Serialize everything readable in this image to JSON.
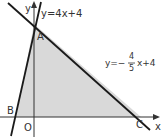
{
  "diagram": {
    "axes": {
      "x_label": "x",
      "y_label": "y",
      "origin_label": "O"
    },
    "lines": [
      {
        "id": "line1",
        "equation_text": "y=4x+4",
        "slope": 4,
        "intercept": 4
      },
      {
        "id": "line2",
        "equation_prefix": "y=−",
        "numerator": "4",
        "denominator": "5",
        "equation_suffix": "x+4",
        "slope": -0.8,
        "intercept": 4
      }
    ],
    "points": {
      "A": {
        "label": "A",
        "x": 0,
        "y": 4
      },
      "B": {
        "label": "B",
        "x": -1,
        "y": 0
      },
      "C": {
        "label": "C",
        "x": 5,
        "y": 0
      }
    },
    "shaded_region": "triangle ABC",
    "colors": {
      "line": "#1a1a1a",
      "axis": "#333333",
      "fill": "#d9d9d9",
      "text": "#333333"
    }
  }
}
